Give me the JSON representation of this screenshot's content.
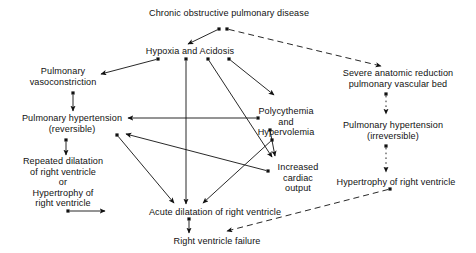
{
  "diagram": {
    "width": 476,
    "height": 253,
    "background_color": "#ffffff",
    "line_color": "#111111",
    "text_color": "#111111",
    "nodes": [
      {
        "id": "copd",
        "label": "Chronic obstructive pulmonary disease",
        "lines": [
          "Chronic obstructive pulmonary disease"
        ],
        "x": 229,
        "y": 13
      },
      {
        "id": "hypoxia",
        "label": "Hypoxia and Acidosis",
        "lines": [
          "Hypoxia and Acidosis"
        ],
        "x": 190,
        "y": 51
      },
      {
        "id": "vasoconstriction",
        "label": "Pulmonary vasoconstriction",
        "lines": [
          "Pulmonary",
          "vasoconstriction"
        ],
        "x": 63,
        "y": 77
      },
      {
        "id": "severe-reduction",
        "label": "Severe anatomic reduction pulmonary vascular bed",
        "lines": [
          "Severe anatomic reduction",
          "pulmonary vascular bed"
        ],
        "x": 398,
        "y": 79
      },
      {
        "id": "polycythemia",
        "label": "Polycythemia and Hypervolemia",
        "lines": [
          "Polycythemia",
          "and",
          "Hypervolemia"
        ],
        "x": 286,
        "y": 122
      },
      {
        "id": "pht-reversible",
        "label": "Pulmonary hypertension (reversible)",
        "lines": [
          "Pulmonary hypertension",
          "(reversible)"
        ],
        "x": 72,
        "y": 124
      },
      {
        "id": "pht-irreversible",
        "label": "Pulmonary hypertension (irreversible)",
        "lines": [
          "Pulmonary hypertension",
          "(irreversible)"
        ],
        "x": 393,
        "y": 131
      },
      {
        "id": "repeated-dilatation",
        "label": "Repeated dilatation of right ventricle or Hypertrophy of right ventricle",
        "lines": [
          "Repeated dilatation",
          "of right ventricle",
          "or",
          "Hypertrophy of",
          "right ventricle"
        ],
        "x": 63,
        "y": 182
      },
      {
        "id": "increased-output",
        "label": "Increased cardiac output",
        "lines": [
          "Increased",
          "cardiac",
          "output"
        ],
        "x": 298,
        "y": 178
      },
      {
        "id": "hypertrophy-rv",
        "label": "Hypertrophy of right ventricle",
        "lines": [
          "Hypertrophy of right ventricle"
        ],
        "x": 396,
        "y": 182
      },
      {
        "id": "acute-dilatation",
        "label": "Acute dilatation of right ventricle",
        "lines": [
          "Acute dilatation of right ventricle"
        ],
        "x": 215,
        "y": 212
      },
      {
        "id": "rv-failure",
        "label": "Right ventricle failure",
        "lines": [
          "Right ventricle failure"
        ],
        "x": 217,
        "y": 241
      }
    ],
    "edges": [
      {
        "id": "copd-to-hypoxia",
        "from": "copd",
        "to": "hypoxia",
        "style": "solid",
        "x1": 219,
        "y1": 29,
        "x2": 188,
        "y2": 44
      },
      {
        "id": "copd-to-severe-reduction",
        "from": "copd",
        "to": "severe-reduction",
        "style": "dashed",
        "x1": 227,
        "y1": 29,
        "x2": 381,
        "y2": 66
      },
      {
        "id": "hypoxia-to-vasoconstriction",
        "from": "hypoxia",
        "to": "vasoconstriction",
        "style": "solid",
        "x1": 158,
        "y1": 59,
        "x2": 101,
        "y2": 74
      },
      {
        "id": "hypoxia-to-acute-dilatation",
        "from": "hypoxia",
        "to": "acute-dilatation",
        "style": "solid",
        "x1": 186,
        "y1": 59,
        "x2": 186,
        "y2": 204
      },
      {
        "id": "hypoxia-to-polycythemia",
        "from": "hypoxia",
        "to": "polycythemia",
        "style": "solid",
        "x1": 229,
        "y1": 59,
        "x2": 274,
        "y2": 95
      },
      {
        "id": "hypoxia-to-increased-output",
        "from": "hypoxia",
        "to": "increased-output",
        "style": "solid",
        "x1": 208,
        "y1": 59,
        "x2": 272,
        "y2": 157
      },
      {
        "id": "vasoconstriction-to-pht-reversible",
        "from": "vasoconstriction",
        "to": "pht-reversible",
        "style": "solid",
        "x1": 73,
        "y1": 93,
        "x2": 73,
        "y2": 111
      },
      {
        "id": "severe-reduction-to-pht-irreversible",
        "from": "severe-reduction",
        "to": "pht-irreversible",
        "style": "dotted",
        "x1": 386,
        "y1": 94,
        "x2": 386,
        "y2": 114
      },
      {
        "id": "polycythemia-to-pht-reversible",
        "from": "polycythemia",
        "to": "pht-reversible",
        "style": "solid",
        "x1": 258,
        "y1": 118,
        "x2": 128,
        "y2": 118
      },
      {
        "id": "polycythemia-to-increased-output",
        "from": "polycythemia",
        "to": "increased-output",
        "style": "solid",
        "x1": 270,
        "y1": 130,
        "x2": 275,
        "y2": 156
      },
      {
        "id": "pht-reversible-to-repeated-dilatation",
        "from": "pht-reversible",
        "to": "repeated-dilatation",
        "style": "solid",
        "x1": 66,
        "y1": 140,
        "x2": 66,
        "y2": 155
      },
      {
        "id": "pht-reversible-to-acute-dilatation",
        "from": "pht-reversible",
        "to": "acute-dilatation",
        "style": "solid",
        "x1": 117,
        "y1": 135,
        "x2": 174,
        "y2": 203
      },
      {
        "id": "pht-irreversible-to-hypertrophy-rv",
        "from": "pht-irreversible",
        "to": "hypertrophy-rv",
        "style": "dotted",
        "x1": 386,
        "y1": 146,
        "x2": 386,
        "y2": 172
      },
      {
        "id": "increased-output-to-pht-reversible",
        "from": "increased-output",
        "to": "pht-reversible",
        "style": "solid",
        "x1": 268,
        "y1": 171,
        "x2": 126,
        "y2": 134
      },
      {
        "id": "acute-dilatation-from-left",
        "from": "repeated-dilatation",
        "to": "acute-dilatation",
        "style": "solid",
        "x1": 68,
        "y1": 211,
        "x2": 105,
        "y2": 211
      },
      {
        "id": "polycythemia-to-acute-dilatation",
        "from": "polycythemia",
        "to": "acute-dilatation",
        "style": "solid",
        "x1": 272,
        "y1": 140,
        "x2": 203,
        "y2": 203
      },
      {
        "id": "acute-dilatation-to-rv-failure",
        "from": "acute-dilatation",
        "to": "rv-failure",
        "style": "solid",
        "x1": 189,
        "y1": 219,
        "x2": 189,
        "y2": 233
      },
      {
        "id": "hypertrophy-rv-to-rv-failure",
        "from": "hypertrophy-rv",
        "to": "rv-failure",
        "style": "dashed",
        "x1": 390,
        "y1": 189,
        "x2": 227,
        "y2": 231
      }
    ]
  }
}
